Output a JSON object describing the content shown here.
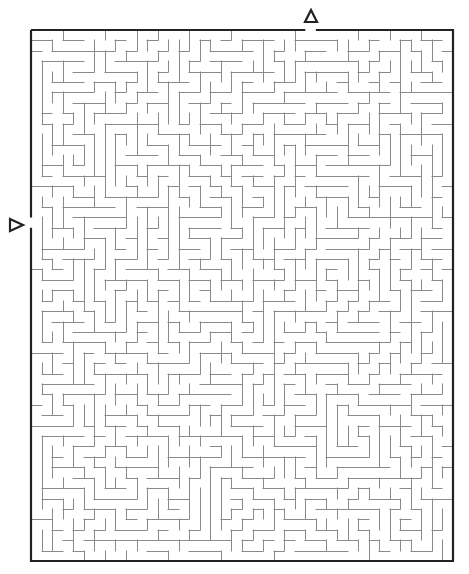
{
  "puzzle": {
    "type": "maze",
    "grid": {
      "cols": 40,
      "rows": 51
    },
    "frame": {
      "left": 31,
      "top": 30,
      "right": 453,
      "bottom": 561
    },
    "colors": {
      "background": "#ffffff",
      "wall": "#8a8a8a",
      "border": "#222222",
      "marker": "#222222"
    },
    "entrances": [
      {
        "name": "top-entrance",
        "side": "top",
        "cell": 26,
        "marker": "triangle-up"
      },
      {
        "name": "left-entrance",
        "side": "left",
        "cell": 18,
        "marker": "triangle-right"
      }
    ],
    "seed": 4217
  }
}
